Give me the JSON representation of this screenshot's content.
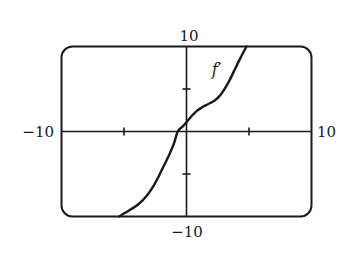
{
  "chart_data": {
    "type": "line",
    "title": "",
    "xlabel": "",
    "ylabel": "",
    "xlim": [
      -10,
      10
    ],
    "ylim": [
      -10,
      10
    ],
    "grid": false,
    "x_ticks": [
      -5,
      5
    ],
    "y_ticks": [
      -5,
      5
    ],
    "tick_labels": {
      "x_min": "−10",
      "x_max": "10",
      "y_min": "−10",
      "y_max": "10"
    },
    "series": [
      {
        "name": "f′",
        "label": "f′",
        "label_position": {
          "x": 2.4,
          "y": 6.6
        },
        "x": [
          -5.4,
          -4.6,
          -3.8,
          -3.2,
          -2.6,
          -2.2,
          -1.8,
          -1.4,
          -1.0,
          -0.7,
          -0.3,
          0.0,
          0.4,
          0.8,
          1.2,
          1.7,
          2.2,
          2.6,
          3.0,
          3.4,
          3.8,
          4.3,
          4.8
        ],
        "y": [
          -10,
          -9.3,
          -8.5,
          -7.6,
          -6.3,
          -5.2,
          -4.0,
          -2.8,
          -1.4,
          0.0,
          0.6,
          1.1,
          1.8,
          2.4,
          2.8,
          3.2,
          3.6,
          4.1,
          4.9,
          5.9,
          7.1,
          8.6,
          10
        ]
      }
    ]
  },
  "colors": {
    "line": "#1a1a1a",
    "background": "#ffffff"
  }
}
